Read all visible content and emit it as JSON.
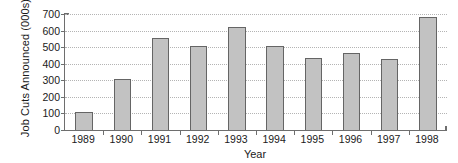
{
  "chart_data": {
    "type": "bar",
    "title": "",
    "xlabel": "Year",
    "ylabel": "Job Cuts Announced (000s)",
    "categories": [
      "1989",
      "1990",
      "1991",
      "1992",
      "1993",
      "1994",
      "1995",
      "1996",
      "1997",
      "1998"
    ],
    "values": [
      110,
      305,
      555,
      505,
      620,
      505,
      432,
      465,
      430,
      680
    ],
    "series": [
      {
        "name": "Job Cuts Announced",
        "values": [
          110,
          305,
          555,
          505,
          620,
          505,
          432,
          465,
          430,
          680
        ]
      }
    ],
    "ylim": [
      0,
      700
    ],
    "ytick_values": [
      0,
      100,
      200,
      300,
      400,
      500,
      600,
      700
    ],
    "ytick_labels": [
      "0",
      "100",
      "200",
      "300",
      "400",
      "500",
      "600",
      "700"
    ],
    "grid": true,
    "grid_axis": "y",
    "grid_style": "dotted",
    "legend": false,
    "legend_position": "none",
    "bar_fill_color": "#c2c2c2",
    "bar_edge_color": "#656565",
    "axis_color": "#6e6e6e",
    "gridline_color": "#b4b4b4",
    "text_color": "#1a1a1a",
    "background_color": "#ffffff"
  }
}
